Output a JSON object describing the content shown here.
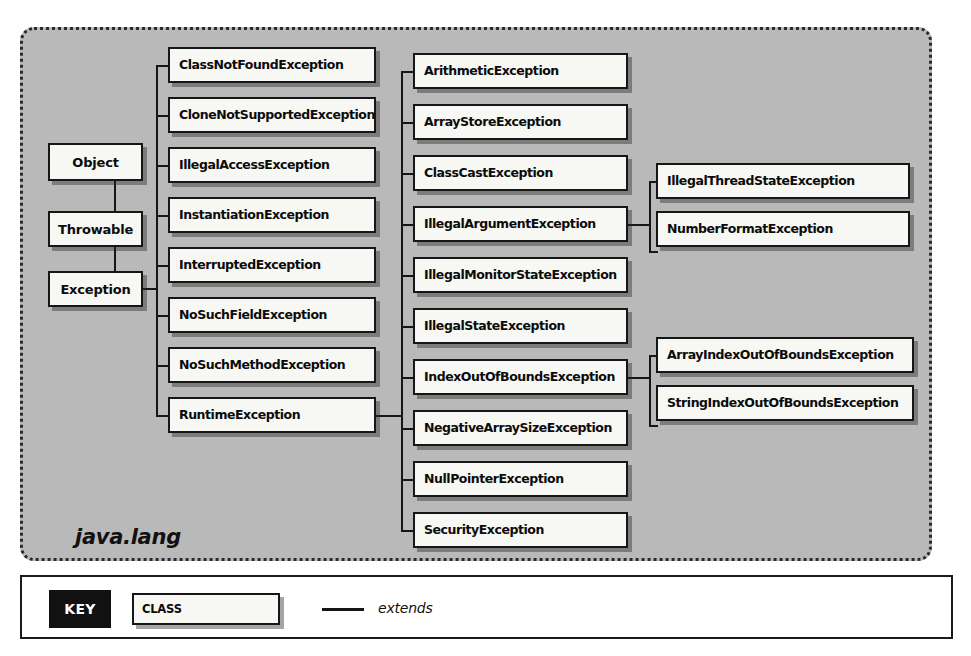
{
  "diagram": {
    "package_label": "java.lang",
    "root_chain": [
      {
        "name": "Object",
        "x": 45,
        "y": 140,
        "w": 95,
        "h": 38
      },
      {
        "name": "Throwable",
        "x": 45,
        "y": 208,
        "w": 95,
        "h": 36
      },
      {
        "name": "Exception",
        "x": 45,
        "y": 268,
        "w": 95,
        "h": 36
      }
    ],
    "exception_subclasses": [
      {
        "name": "ClassNotFoundException",
        "x": 165,
        "y": 44,
        "w": 208,
        "h": 36
      },
      {
        "name": "CloneNotSupportedException",
        "x": 165,
        "y": 94,
        "w": 208,
        "h": 36
      },
      {
        "name": "IllegalAccessException",
        "x": 165,
        "y": 144,
        "w": 208,
        "h": 36
      },
      {
        "name": "InstantiationException",
        "x": 165,
        "y": 194,
        "w": 208,
        "h": 36
      },
      {
        "name": "InterruptedException",
        "x": 165,
        "y": 244,
        "w": 208,
        "h": 36
      },
      {
        "name": "NoSuchFieldException",
        "x": 165,
        "y": 294,
        "w": 208,
        "h": 36
      },
      {
        "name": "NoSuchMethodException",
        "x": 165,
        "y": 344,
        "w": 208,
        "h": 36
      },
      {
        "name": "RuntimeException",
        "x": 165,
        "y": 394,
        "w": 208,
        "h": 36
      }
    ],
    "runtime_subclasses": [
      {
        "name": "ArithmeticException",
        "x": 410,
        "y": 50,
        "w": 215,
        "h": 36
      },
      {
        "name": "ArrayStoreException",
        "x": 410,
        "y": 101,
        "w": 215,
        "h": 36
      },
      {
        "name": "ClassCastException",
        "x": 410,
        "y": 152,
        "w": 215,
        "h": 36
      },
      {
        "name": "IllegalArgumentException",
        "x": 410,
        "y": 203,
        "w": 215,
        "h": 36
      },
      {
        "name": "IllegalMonitorStateException",
        "x": 410,
        "y": 254,
        "w": 215,
        "h": 36
      },
      {
        "name": "IllegalStateException",
        "x": 410,
        "y": 305,
        "w": 215,
        "h": 36
      },
      {
        "name": "IndexOutOfBoundsException",
        "x": 410,
        "y": 356,
        "w": 215,
        "h": 36
      },
      {
        "name": "NegativeArraySizeException",
        "x": 410,
        "y": 407,
        "w": 215,
        "h": 36
      },
      {
        "name": "NullPointerException",
        "x": 410,
        "y": 458,
        "w": 215,
        "h": 36
      },
      {
        "name": "SecurityException",
        "x": 410,
        "y": 509,
        "w": 215,
        "h": 36
      }
    ],
    "illegal_argument_subclasses": [
      {
        "name": "IllegalThreadStateException",
        "x": 653,
        "y": 160,
        "w": 254,
        "h": 36
      },
      {
        "name": "NumberFormatException",
        "x": 653,
        "y": 208,
        "w": 254,
        "h": 36
      }
    ],
    "index_out_of_bounds_subclasses": [
      {
        "name": "ArrayIndexOutOfBoundsException",
        "x": 653,
        "y": 334,
        "w": 258,
        "h": 36
      },
      {
        "name": "StringIndexOutOfBoundsException",
        "x": 653,
        "y": 382,
        "w": 258,
        "h": 36
      }
    ]
  },
  "key": {
    "badge_label": "KEY",
    "class_label": "CLASS",
    "extends_label": "extends"
  },
  "colors": {
    "panel_background": "#b9b9b9",
    "box_fill": "#f7f7f4",
    "line": "#161616",
    "badge_background": "#111111",
    "badge_text": "#ffffff",
    "page_background": "#ffffff"
  }
}
